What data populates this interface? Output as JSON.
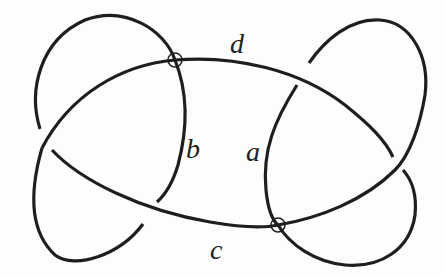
{
  "diagram": {
    "type": "virtual knot diagram",
    "labels": {
      "a": "a",
      "b": "b",
      "c": "c",
      "d": "d"
    },
    "virtual_crossings": 2,
    "classical_crossings": 4,
    "colors": {
      "stroke": "#1e1e1e",
      "background": "#fdfdfd"
    }
  }
}
